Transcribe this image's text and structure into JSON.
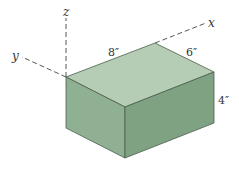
{
  "figure": {
    "type": "isometric-box-diagram",
    "axes": {
      "x_label": "x",
      "y_label": "y",
      "z_label": "z"
    },
    "dimensions": {
      "length_label": "8″",
      "width_label": "6″",
      "height_label": "4″"
    },
    "colors": {
      "top_face": "#b4cdb4",
      "left_face": "#8fb092",
      "right_face": "#7fa283",
      "edge": "#4a5e4c",
      "axis": "#555555"
    }
  }
}
